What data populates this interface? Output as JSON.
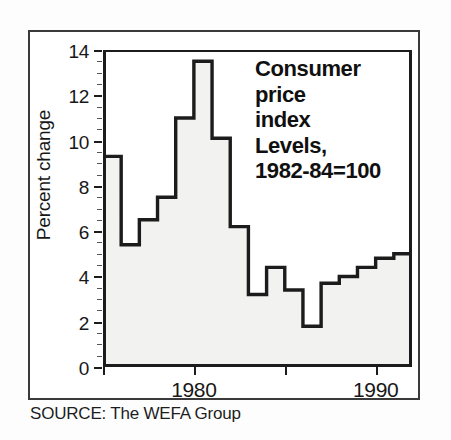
{
  "figure": {
    "source_note": "SOURCE: The WEFA Group"
  },
  "chart_data": {
    "type": "area",
    "subtype": "step-area",
    "title_lines": [
      "Consumer",
      "price",
      "index",
      "Levels,",
      "1982-84=100"
    ],
    "xlabel": "",
    "ylabel": "Percent change",
    "x": [
      1975,
      1976,
      1977,
      1978,
      1979,
      1980,
      1981,
      1982,
      1983,
      1984,
      1985,
      1986,
      1987,
      1988,
      1989,
      1990,
      1991
    ],
    "values": [
      9.3,
      5.4,
      6.5,
      7.5,
      11.0,
      13.5,
      10.1,
      6.2,
      3.2,
      4.4,
      3.4,
      1.8,
      3.7,
      4.0,
      4.4,
      4.8,
      5.0
    ],
    "ylim": [
      0,
      14
    ],
    "xlim": [
      1975,
      1992
    ],
    "yticks": [
      0,
      2,
      4,
      6,
      8,
      10,
      12,
      14
    ],
    "ytick_labels": [
      "0",
      "2",
      "4",
      "6",
      "8",
      "10",
      "12",
      "14"
    ],
    "xticks": [
      1980,
      1990
    ],
    "xtick_labels": [
      "1980",
      "1990"
    ],
    "xticks_unlabeled": [
      1975,
      1985
    ],
    "grid": false,
    "legend": null,
    "line_color": "#1c1c1c",
    "fill_color": "#f2f2f0",
    "background_color": "#ffffff"
  }
}
